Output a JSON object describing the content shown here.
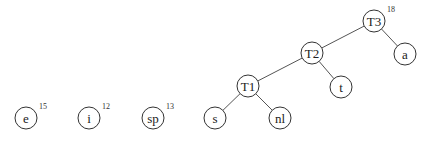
{
  "diagram": {
    "type": "huffman-tree-construction",
    "colors": {
      "edge": "#555555",
      "node_stroke": "#333333",
      "text": "#222222",
      "background": "#ffffff"
    },
    "nodes": [
      {
        "id": "e",
        "label": "e",
        "x": 26,
        "y": 118,
        "weight": "15"
      },
      {
        "id": "i",
        "label": "i",
        "x": 89,
        "y": 118,
        "weight": "12"
      },
      {
        "id": "sp",
        "label": "sp",
        "x": 153,
        "y": 118,
        "weight": "13"
      },
      {
        "id": "s",
        "label": "s",
        "x": 215,
        "y": 118,
        "weight": ""
      },
      {
        "id": "nl",
        "label": "nl",
        "x": 280,
        "y": 118,
        "weight": ""
      },
      {
        "id": "T1",
        "label": "T1",
        "x": 248,
        "y": 86,
        "weight": ""
      },
      {
        "id": "t",
        "label": "t",
        "x": 341,
        "y": 87,
        "weight": ""
      },
      {
        "id": "T2",
        "label": "T2",
        "x": 312,
        "y": 53,
        "weight": ""
      },
      {
        "id": "a",
        "label": "a",
        "x": 405,
        "y": 54,
        "weight": ""
      },
      {
        "id": "T3",
        "label": "T3",
        "x": 374,
        "y": 21,
        "weight": "18"
      }
    ],
    "edges": [
      {
        "from": "T3",
        "to": "T2"
      },
      {
        "from": "T3",
        "to": "a"
      },
      {
        "from": "T2",
        "to": "T1"
      },
      {
        "from": "T2",
        "to": "t"
      },
      {
        "from": "T1",
        "to": "s"
      },
      {
        "from": "T1",
        "to": "nl"
      }
    ],
    "node_radius": 11
  }
}
